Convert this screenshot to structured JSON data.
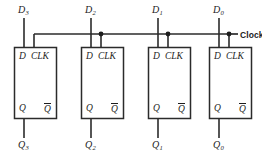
{
  "diagram": {
    "name": "4-bit D flip-flop register",
    "type": "logic-circuit-schematic",
    "clock_label": "Clock",
    "colors": {
      "wire": "#2b2b2b",
      "text": "#1d1d1d",
      "background": "#ffffff",
      "junction": "#1d1d1d"
    },
    "ports": {
      "d_label": "D",
      "clk_label": "CLK",
      "q_label": "Q",
      "qbar_label": "Q"
    },
    "flipflops": [
      {
        "index": 3,
        "input_label": "D",
        "input_sub": "3",
        "output_label": "Q",
        "output_sub": "3",
        "port_d": "D",
        "port_clk": "CLK",
        "port_q": "Q",
        "port_qbar": "Q"
      },
      {
        "index": 2,
        "input_label": "D",
        "input_sub": "2",
        "output_label": "Q",
        "output_sub": "2",
        "port_d": "D",
        "port_clk": "CLK",
        "port_q": "Q",
        "port_qbar": "Q"
      },
      {
        "index": 1,
        "input_label": "D",
        "input_sub": "1",
        "output_label": "Q",
        "output_sub": "1",
        "port_d": "D",
        "port_clk": "CLK",
        "port_q": "Q",
        "port_qbar": "Q"
      },
      {
        "index": 0,
        "input_label": "D",
        "input_sub": "0",
        "output_label": "Q",
        "output_sub": "0",
        "port_d": "D",
        "port_clk": "CLK",
        "port_q": "Q",
        "port_qbar": "Q"
      }
    ]
  }
}
